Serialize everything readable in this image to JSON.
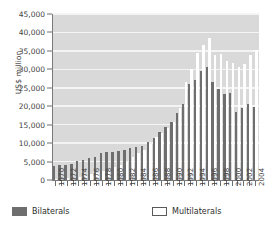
{
  "chart_data": {
    "type": "bar",
    "title": "",
    "xlabel": "",
    "ylabel": "US$ million",
    "ylim": [
      0,
      45000
    ],
    "ytick_step": 5000,
    "ytick_labels": [
      "0",
      "5,000",
      "10,000",
      "15,000",
      "20,000",
      "25,000",
      "30,000",
      "35,000",
      "40,000",
      "45,000"
    ],
    "ytick_values": [
      0,
      5000,
      10000,
      15000,
      20000,
      25000,
      30000,
      35000,
      40000,
      45000
    ],
    "grid": true,
    "grid_axis": "y",
    "legend_position": "bottom",
    "categories": [
      1970,
      1971,
      1972,
      1973,
      1974,
      1975,
      1976,
      1977,
      1978,
      1979,
      1980,
      1981,
      1982,
      1983,
      1984,
      1985,
      1986,
      1987,
      1988,
      1989,
      1990,
      1991,
      1992,
      1993,
      1994,
      1995,
      1996,
      1997,
      1998,
      1999,
      2000,
      2001,
      2002,
      2003,
      2004
    ],
    "xtick_labels": [
      "1970",
      "1972",
      "1974",
      "1976",
      "1978",
      "1980",
      "1982",
      "1984",
      "1986",
      "1988",
      "1990",
      "1992",
      "1994",
      "1996",
      "1998",
      "2000",
      "2002",
      "2004"
    ],
    "series": [
      {
        "name": "Bilaterals",
        "color": "#6e6e6e",
        "values": [
          3900,
          4000,
          4100,
          4400,
          5100,
          5500,
          5900,
          6300,
          7200,
          7500,
          7600,
          7900,
          8100,
          8800,
          9000,
          9200,
          10300,
          11500,
          13100,
          14500,
          15800,
          18100,
          20600,
          25900,
          27200,
          29600,
          30600,
          26600,
          24600,
          23200,
          23700,
          18500,
          19500,
          20700,
          19700
        ]
      },
      {
        "name": "Multilaterals",
        "color": "#ffffff",
        "values": [
          300,
          400,
          500,
          700,
          900,
          1200,
          1500,
          1900,
          2400,
          3000,
          3500,
          4200,
          5000,
          6200,
          7300,
          8100,
          9700,
          11600,
          12700,
          14200,
          15700,
          19600,
          26700,
          30100,
          34500,
          36700,
          38400,
          34000,
          34200,
          32200,
          31600,
          30600,
          31400,
          34000,
          35300
        ]
      }
    ]
  },
  "legend": {
    "bilaterals_label": "Bilaterals",
    "multilaterals_label": "Multilaterals"
  },
  "axis": {
    "y_title": "US$ million"
  }
}
